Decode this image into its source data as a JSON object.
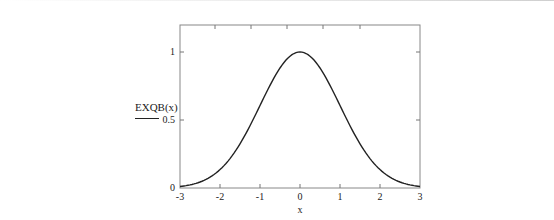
{
  "chart_data": {
    "type": "line",
    "title": "",
    "xlabel": "x",
    "ylabel": "EXQB(x)",
    "xlim": [
      -3,
      3
    ],
    "ylim": [
      0,
      1.2
    ],
    "x_ticks": [
      "-3",
      "-2",
      "-1",
      "0",
      "1",
      "2",
      "3"
    ],
    "y_ticks": [
      "0",
      "0.5",
      "1"
    ],
    "grid": false,
    "legend": null,
    "series": [
      {
        "name": "EXQB(x)",
        "x": [
          -3,
          -2.5,
          -2,
          -1.5,
          -1,
          -0.5,
          0,
          0.5,
          1,
          1.5,
          2,
          2.5,
          3
        ],
        "values": [
          0.011,
          0.044,
          0.135,
          0.325,
          0.607,
          0.882,
          1.0,
          0.882,
          0.607,
          0.325,
          0.135,
          0.044,
          0.011
        ]
      }
    ]
  },
  "labels": {
    "ylabel": "EXQB(x)",
    "xlabel": "x",
    "xt": [
      "-3",
      "-2",
      "-1",
      "0",
      "1",
      "2",
      "3"
    ],
    "yt": [
      "0",
      "0.5",
      "1"
    ]
  },
  "colors": {
    "axis": "#777777",
    "line": "#222222"
  }
}
